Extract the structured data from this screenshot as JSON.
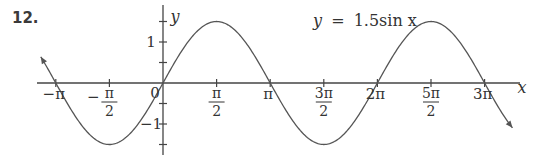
{
  "problem": {
    "number": "12."
  },
  "chart_data": {
    "type": "line",
    "title": "y = 1.5sin x",
    "equation": {
      "lhs": "y",
      "eq": "=",
      "rhs": "1.5sin x"
    },
    "xlabel": "x",
    "ylabel": "y",
    "function": "1.5*sin(x)",
    "amplitude": 1.5,
    "xlim": [
      -3.3,
      3.5
    ],
    "xlim_units": "pi",
    "ylim": [
      -1.7,
      1.9
    ],
    "x_ticks": [
      {
        "value_pi": -1,
        "label": "−π"
      },
      {
        "value_pi": -0.5,
        "label_num": "π",
        "label_den": "2",
        "sign": "−"
      },
      {
        "value_pi": 0,
        "label": "0"
      },
      {
        "value_pi": 0.5,
        "label_num": "π",
        "label_den": "2",
        "sign": ""
      },
      {
        "value_pi": 1,
        "label": "π"
      },
      {
        "value_pi": 1.5,
        "label_num": "3π",
        "label_den": "2",
        "sign": ""
      },
      {
        "value_pi": 2,
        "label": "2π"
      },
      {
        "value_pi": 2.5,
        "label_num": "5π",
        "label_den": "2",
        "sign": ""
      },
      {
        "value_pi": 3,
        "label": "3π"
      }
    ],
    "y_ticks": [
      {
        "value": 1.5,
        "label": ""
      },
      {
        "value": 1,
        "label": "1"
      },
      {
        "value": 0.5,
        "label": ""
      },
      {
        "value": -0.5,
        "label": ""
      },
      {
        "value": -1,
        "label": "−1"
      },
      {
        "value": -1.5,
        "label": ""
      }
    ],
    "key_points": [
      {
        "x": "-π",
        "y": 0
      },
      {
        "x": "-π/2",
        "y": -1.5
      },
      {
        "x": "0",
        "y": 0
      },
      {
        "x": "π/2",
        "y": 1.5
      },
      {
        "x": "π",
        "y": 0
      },
      {
        "x": "3π/2",
        "y": -1.5
      },
      {
        "x": "2π",
        "y": 0
      },
      {
        "x": "5π/2",
        "y": 1.5
      },
      {
        "x": "3π",
        "y": 0
      }
    ],
    "grid": false,
    "arrows_on_curve_ends": true,
    "colors": {
      "curve": "#555555",
      "axis": "#444444",
      "text": "#333333"
    }
  }
}
